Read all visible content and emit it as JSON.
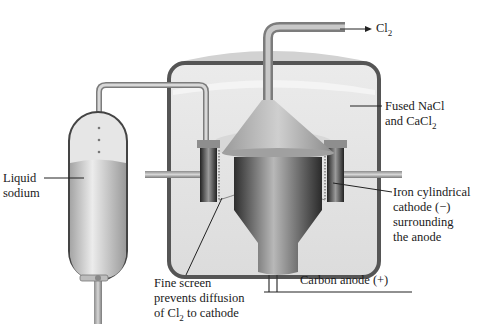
{
  "diagram": {
    "labels": {
      "cl2_outlet": {
        "prefix": "Cl",
        "sub": "2"
      },
      "fused_salt": {
        "line1": "Fused NaCl",
        "line2_prefix": "and CaCl",
        "line2_sub": "2"
      },
      "liquid_sodium": {
        "line1": "Liquid",
        "line2": "sodium"
      },
      "cathode": {
        "line1": "Iron cylindrical",
        "line2": "cathode (−)",
        "line3": "surrounding",
        "line4": "the anode"
      },
      "anode": {
        "text": "Carbon anode (+)"
      },
      "screen": {
        "line1": "Fine screen",
        "line2": "prevents diffusion",
        "line3_prefix": "of Cl",
        "line3_sub": "2",
        "line3_suffix": " to cathode"
      }
    },
    "components": [
      "cl2-outlet-pipe",
      "cell-tank",
      "fused-salt-electrolyte",
      "collection-cone",
      "carbon-anode",
      "iron-cylindrical-cathode",
      "fine-screen",
      "sodium-overflow-pipe",
      "sodium-collection-vessel",
      "drain-valve"
    ],
    "colors": {
      "tank_wall": "#555555",
      "electrolyte": "#e4e4e4",
      "pipe": "#a9a9a9",
      "anode_dark": "#3a3a3a",
      "sodium_fill": "#cfcfcf",
      "text": "#1a1a1a"
    }
  }
}
